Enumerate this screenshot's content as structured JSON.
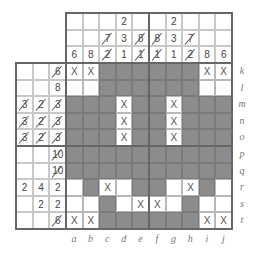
{
  "puzzle": {
    "type": "nonogram",
    "columns": [
      "a",
      "b",
      "c",
      "d",
      "e",
      "f",
      "g",
      "h",
      "i",
      "j"
    ],
    "rows": [
      "k",
      "l",
      "m",
      "n",
      "o",
      "p",
      "q",
      "r",
      "s",
      "t"
    ],
    "column_clues": [
      [
        {
          "v": "6",
          "s": false
        }
      ],
      [
        {
          "v": "8",
          "s": false
        }
      ],
      [
        {
          "v": "7",
          "s": true
        },
        {
          "v": "2",
          "s": true
        }
      ],
      [
        {
          "v": "2",
          "s": false
        },
        {
          "v": "3",
          "s": false
        },
        {
          "v": "1",
          "s": false
        }
      ],
      [
        {
          "v": "8",
          "s": true
        },
        {
          "v": "1",
          "s": true
        }
      ],
      [
        {
          "v": "8",
          "s": true
        },
        {
          "v": "1",
          "s": true
        }
      ],
      [
        {
          "v": "2",
          "s": false
        },
        {
          "v": "3",
          "s": false
        },
        {
          "v": "1",
          "s": false
        }
      ],
      [
        {
          "v": "7",
          "s": true
        },
        {
          "v": "2",
          "s": true
        }
      ],
      [
        {
          "v": "8",
          "s": false
        }
      ],
      [
        {
          "v": "6",
          "s": false
        }
      ]
    ],
    "row_clues": [
      [
        {
          "v": "6",
          "s": true
        }
      ],
      [
        {
          "v": "8",
          "s": false
        }
      ],
      [
        {
          "v": "3",
          "s": true
        },
        {
          "v": "2",
          "s": true
        },
        {
          "v": "3",
          "s": true
        }
      ],
      [
        {
          "v": "3",
          "s": true
        },
        {
          "v": "2",
          "s": true
        },
        {
          "v": "3",
          "s": true
        }
      ],
      [
        {
          "v": "3",
          "s": true
        },
        {
          "v": "2",
          "s": true
        },
        {
          "v": "3",
          "s": true
        }
      ],
      [
        {
          "v": "10",
          "s": true
        }
      ],
      [
        {
          "v": "10",
          "s": true
        }
      ],
      [
        {
          "v": "2",
          "s": false
        },
        {
          "v": "4",
          "s": false
        },
        {
          "v": "2",
          "s": false
        }
      ],
      [
        {
          "v": "2",
          "s": false
        },
        {
          "v": "2",
          "s": false
        }
      ],
      [
        {
          "v": "6",
          "s": true
        }
      ]
    ],
    "grid": [
      [
        "x",
        "x",
        "f",
        "f",
        "f",
        "f",
        "f",
        "f",
        "x",
        "x"
      ],
      [
        "e",
        "e",
        "f",
        "f",
        "f",
        "f",
        "f",
        "f",
        "e",
        "e"
      ],
      [
        "f",
        "f",
        "f",
        "x",
        "f",
        "f",
        "x",
        "f",
        "f",
        "f"
      ],
      [
        "f",
        "f",
        "f",
        "x",
        "f",
        "f",
        "x",
        "f",
        "f",
        "f"
      ],
      [
        "f",
        "f",
        "f",
        "x",
        "f",
        "f",
        "x",
        "f",
        "f",
        "f"
      ],
      [
        "f",
        "f",
        "f",
        "f",
        "f",
        "f",
        "f",
        "f",
        "f",
        "f"
      ],
      [
        "f",
        "f",
        "f",
        "f",
        "f",
        "f",
        "f",
        "f",
        "f",
        "f"
      ],
      [
        "e",
        "f",
        "x",
        "e",
        "f",
        "f",
        "e",
        "x",
        "f",
        "e"
      ],
      [
        "e",
        "e",
        "f",
        "e",
        "x",
        "x",
        "e",
        "f",
        "e",
        "e"
      ],
      [
        "x",
        "x",
        "f",
        "f",
        "f",
        "f",
        "f",
        "f",
        "x",
        "x"
      ]
    ],
    "x_mark": "X",
    "colors": {
      "filled": "#8c8c8c",
      "grid_line": "#b8b8b8",
      "frame": "#666666"
    }
  }
}
